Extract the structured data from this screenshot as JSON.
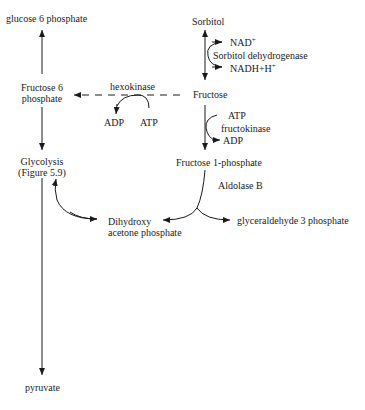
{
  "nodes": {
    "glucose6p": "glucose 6 phosphate",
    "sorbitol": "Sorbitol",
    "nad": "NAD",
    "nad_sup": "+",
    "sorbitol_dh": "Sorbitol dehydrogenase",
    "nadh": "NADH+H",
    "nadh_sup": "+",
    "fructose6p_line1": "Fructose 6",
    "fructose6p_line2": "phosphate",
    "hexokinase": "hexokinase",
    "hk_adp": "ADP",
    "hk_atp": "ATP",
    "fructose": "Fructose",
    "fk_atp": "ATP",
    "fructokinase": "fructokinase",
    "fk_adp": "ADP",
    "glycolysis_line1": "Glycolysis",
    "glycolysis_line2": "(Figure 5.9)",
    "fructose1p": "Fructose 1-phosphate",
    "aldolase_b": "Aldolase B",
    "dhap_line1": "Dihydroxy",
    "dhap_line2": "acetone phosphate",
    "g3p": "glyceraldehyde 3 phosphate",
    "pyruvate": "pyruvate"
  },
  "colors": {
    "line": "#1a1a1a",
    "text": "#1a1a1a",
    "background": "#ffffff"
  }
}
